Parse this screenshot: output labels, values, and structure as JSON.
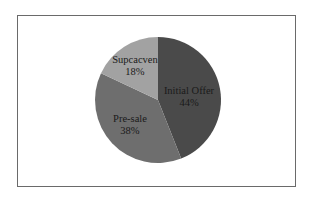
{
  "chart_data": {
    "type": "pie",
    "title": "",
    "start_angle_deg": 0,
    "direction": "clockwise",
    "slices": [
      {
        "label": "Initial Offer",
        "value": 44,
        "display": "44%",
        "color": "#4a4a4a",
        "label_pos": [
          189,
          97
        ]
      },
      {
        "label": "Pre-sale",
        "value": 38,
        "display": "38%",
        "color": "#6e6e6e",
        "label_pos": [
          130,
          125
        ]
      },
      {
        "label": "Supcacven",
        "value": 18,
        "display": "18%",
        "color": "#a2a2a2",
        "label_pos": [
          135,
          66
        ]
      }
    ],
    "legend": "none",
    "units": "%"
  },
  "layout": {
    "cx": 158,
    "cy": 100,
    "r": 63
  }
}
